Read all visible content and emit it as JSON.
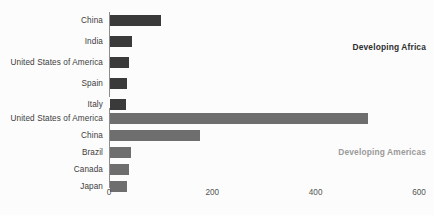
{
  "chart_data": {
    "type": "bar",
    "orientation": "horizontal",
    "title": "",
    "xlabel": "",
    "ylabel": "",
    "xlim": [
      0,
      600
    ],
    "xticks": [
      0,
      200,
      400,
      600
    ],
    "grid": false,
    "legend_position": "inside-right-annotation",
    "groups": [
      {
        "name": "Developing Africa",
        "annotation": "Developing Africa",
        "color": "#3a3a3a",
        "categories": [
          "China",
          "India",
          "United States of America",
          "Spain",
          "Italy"
        ],
        "values": [
          98,
          42,
          36,
          33,
          31
        ]
      },
      {
        "name": "Developing Americas",
        "annotation": "Developing Americas",
        "color": "#6e6e6e",
        "categories": [
          "United States of America",
          "China",
          "Brazil",
          "Canada",
          "Japan"
        ],
        "values": [
          500,
          174,
          40,
          37,
          33
        ]
      }
    ]
  },
  "colors": {
    "background": "#fcfcfc",
    "bar_dark": "#3a3a3a",
    "bar_mid": "#6e6e6e",
    "axis": "#8c8c8c",
    "label_text": "#3c3c3c",
    "tick_text": "#555555",
    "annotation_africa": "#2f2f2f",
    "annotation_americas": "#9a9a9a"
  }
}
